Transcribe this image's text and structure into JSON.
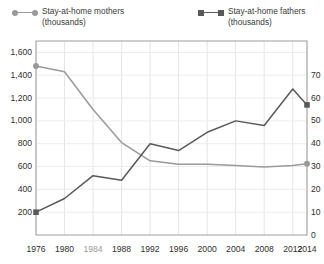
{
  "legend": {
    "items": [
      {
        "name": "Stay-at-home mothers",
        "unit": "(thousands)",
        "marker": "circle-marker",
        "color": "#9a9a9a"
      },
      {
        "name": "Stay-at-home fathers",
        "unit": "(thousands)",
        "marker": "square-marker",
        "color": "#595959"
      }
    ]
  },
  "chart_data": {
    "type": "line",
    "title": "",
    "xlabel": "",
    "ylabel": "",
    "grid": true,
    "legend_position": "top",
    "x": [
      1976,
      1980,
      1984,
      1988,
      1992,
      1996,
      2000,
      2004,
      2008,
      2012,
      2014
    ],
    "xticklabels": [
      "1976",
      "1980",
      "1984",
      "1988",
      "1992",
      "1996",
      "2000",
      "2004",
      "2008",
      "2012",
      "2014"
    ],
    "left_axis": {
      "label": "Stay-at-home mothers (thousands)",
      "ticks": [
        200,
        400,
        600,
        800,
        1000,
        1200,
        1400,
        1600
      ],
      "ticklabels": [
        "200",
        "400",
        "600",
        "800",
        "1,000",
        "1,200",
        "1,400",
        "1,600"
      ],
      "ylim": [
        0,
        1700
      ]
    },
    "right_axis": {
      "label": "Stay-at-home fathers (thousands)",
      "ticks": [
        0,
        10,
        20,
        30,
        40,
        50,
        60,
        70
      ],
      "ticklabels": [
        "0",
        "10",
        "20",
        "30",
        "40",
        "50",
        "60",
        "70"
      ],
      "ylim": [
        0,
        85
      ]
    },
    "series": [
      {
        "name": "Stay-at-home mothers (thousands)",
        "axis": "left",
        "color": "#9a9a9a",
        "marker": "circle",
        "values": [
          1480,
          1430,
          1100,
          810,
          650,
          620,
          620,
          610,
          595,
          610,
          625
        ]
      },
      {
        "name": "Stay-at-home fathers (thousands)",
        "axis": "right",
        "color": "#595959",
        "marker": "square",
        "values": [
          10,
          16,
          26,
          24,
          40,
          37,
          45,
          50,
          48,
          64,
          57
        ]
      }
    ]
  }
}
